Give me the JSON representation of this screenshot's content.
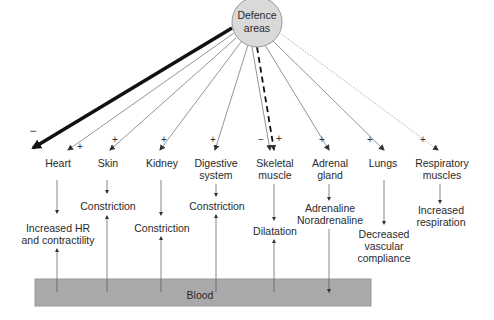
{
  "center": {
    "line1": "Defence",
    "line2": "areas",
    "fill": "#d9d9d9"
  },
  "organs": [
    {
      "id": "heart",
      "lines": [
        "Heart"
      ],
      "sign": "+",
      "extra_sign": "−",
      "effect": [
        "Increased HR",
        "and contractility"
      ]
    },
    {
      "id": "skin",
      "lines": [
        "Skin"
      ],
      "sign": "+",
      "effect": [
        "Constriction"
      ]
    },
    {
      "id": "kidney",
      "lines": [
        "Kidney"
      ],
      "sign": "+",
      "effect": [
        "Constriction"
      ]
    },
    {
      "id": "digestive",
      "lines": [
        "Digestive",
        "system"
      ],
      "sign": "+",
      "effect": [
        "Constriction"
      ]
    },
    {
      "id": "skeletal",
      "lines": [
        "Skeletal",
        "muscle"
      ],
      "sign": "+",
      "extra_sign": "−",
      "effect": [
        "Dilatation"
      ]
    },
    {
      "id": "adrenal",
      "lines": [
        "Adrenal",
        "gland"
      ],
      "sign": "+",
      "effect": [
        "Adrenaline",
        "Noradrenaline"
      ]
    },
    {
      "id": "lungs",
      "lines": [
        "Lungs"
      ],
      "sign": "+",
      "effect": [
        "Decreased",
        "vascular",
        "compliance"
      ]
    },
    {
      "id": "respiratory",
      "lines": [
        "Respiratory",
        "muscles"
      ],
      "sign": "+",
      "effect": [
        "Increased",
        "respiration"
      ]
    }
  ],
  "blood": {
    "label": "Blood",
    "fill": "#a9a9a9"
  }
}
